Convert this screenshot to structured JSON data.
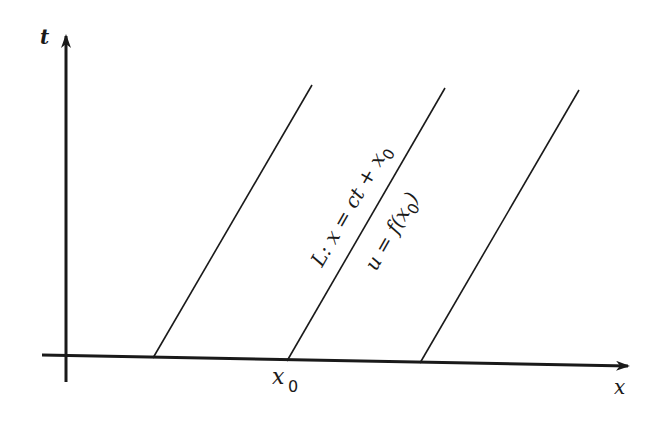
{
  "diagram": {
    "type": "characteristic-lines",
    "axes": {
      "vertical_label": "t",
      "horizontal_label": "x"
    },
    "x_tick_label": {
      "main": "x",
      "sub": "0"
    },
    "characteristic_line": {
      "equation": "L: x = ct + x",
      "equation_sub": "0",
      "value_label": "u = f(x",
      "value_sub": "0",
      "value_close": ")"
    },
    "line_count": 3,
    "colors": {
      "ink": "#1a1a1a",
      "background": "#ffffff"
    }
  }
}
